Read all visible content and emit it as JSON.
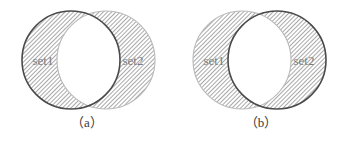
{
  "figure": {
    "background_color": "#ffffff",
    "hatch_color": "#8d8d8d",
    "hatch_angle_deg": 45,
    "label_color": "#7c7c7c",
    "outline_strong_color": "#4a4a4a",
    "outline_soft_color": "#b9b9b9",
    "intersection_fill": "#ffffff",
    "panels": [
      {
        "id": "a",
        "caption": "（a）",
        "left_label": "set1",
        "right_label": "set2",
        "emphasized_circle": "left",
        "left_outline": "strong",
        "right_outline": "soft",
        "shaded_regions": "both-circles-minus-intersection",
        "intersection_shaded": false
      },
      {
        "id": "b",
        "caption": "（b）",
        "left_label": "set1",
        "right_label": "set2",
        "emphasized_circle": "right",
        "left_outline": "soft",
        "right_outline": "strong",
        "shaded_regions": "both-circles-minus-intersection",
        "intersection_shaded": false
      }
    ]
  }
}
